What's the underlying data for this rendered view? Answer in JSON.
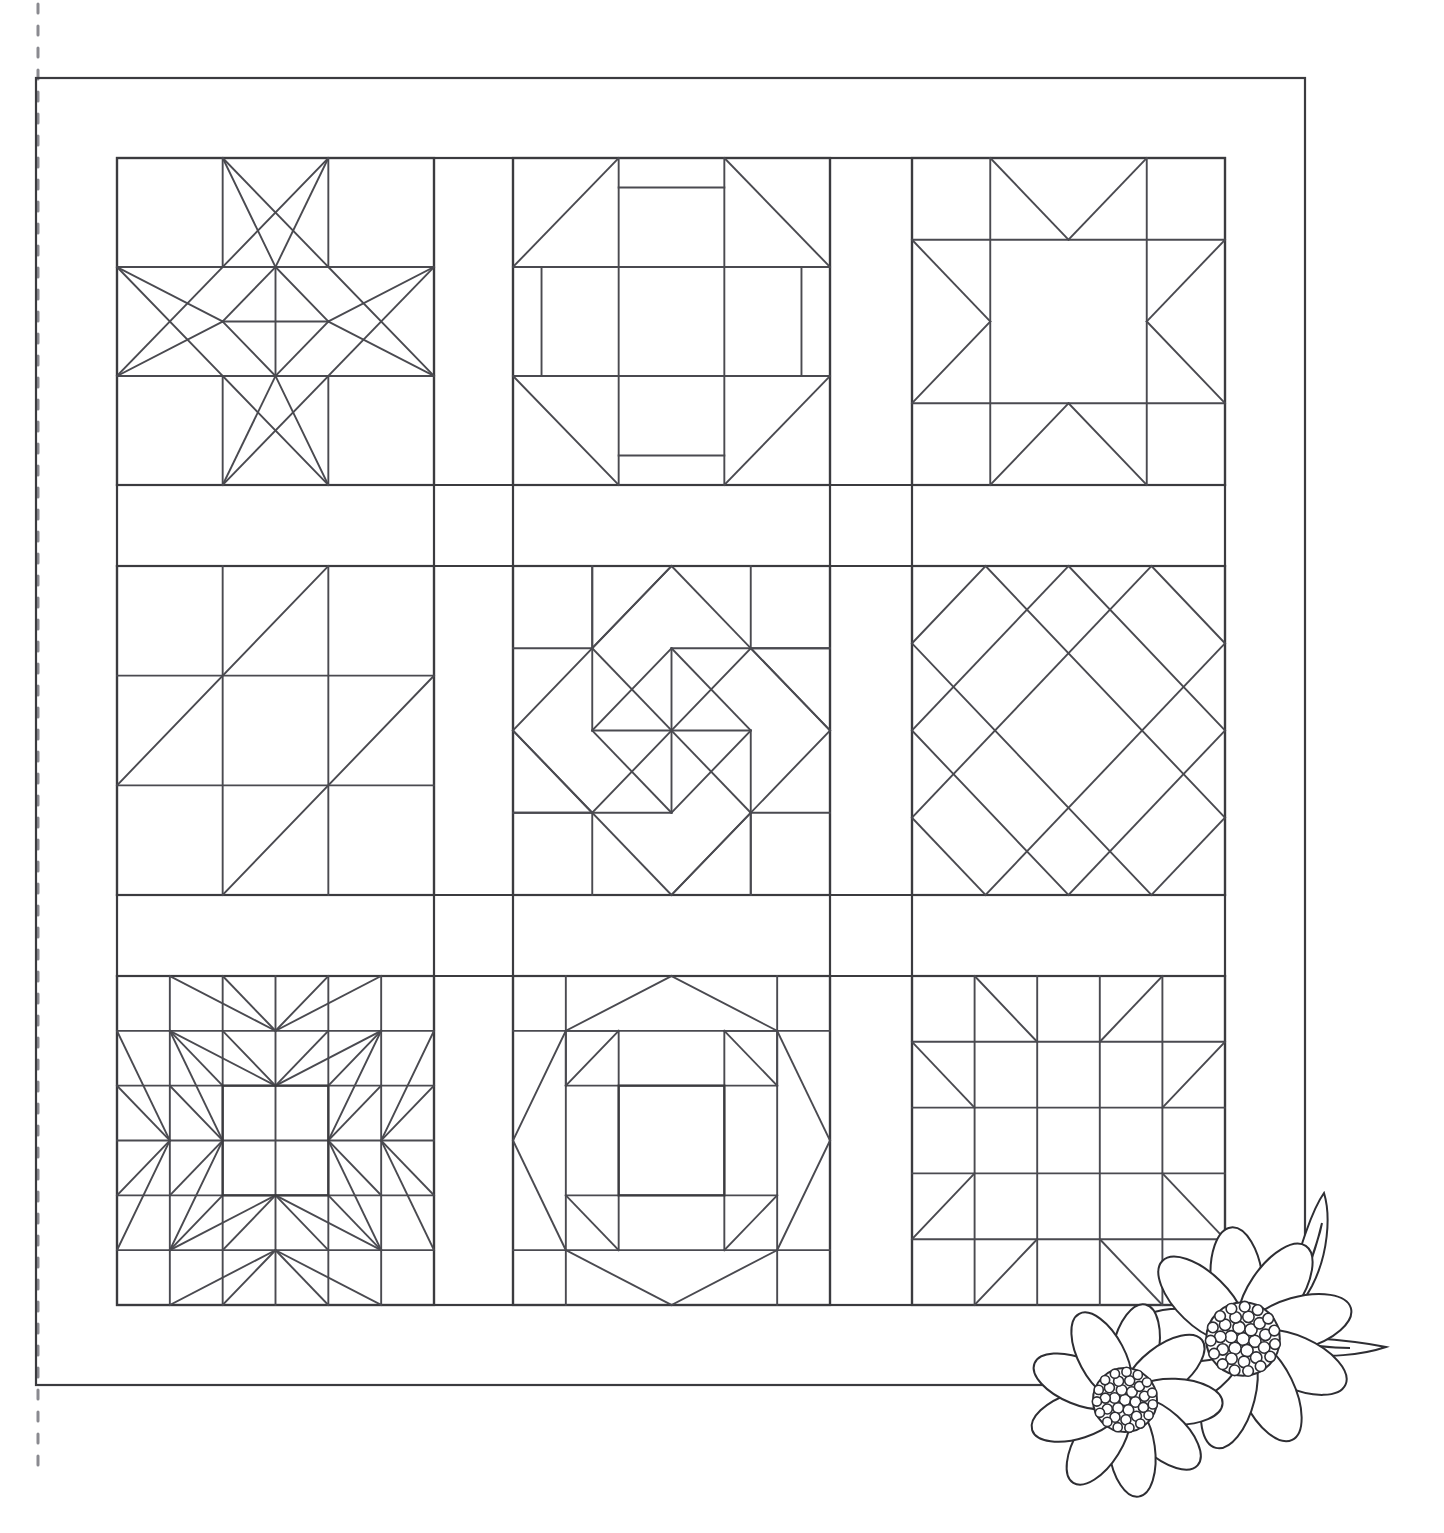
{
  "document": {
    "title": "Sampler Quilt Pattern Line Drawing",
    "type": "quilt-block-layout-diagram",
    "style": "black-and-white line art / coloring page",
    "background_color": "#ffffff",
    "line_color": "#3b3b3f"
  },
  "canvas": {
    "width": 1444,
    "height": 1533
  },
  "binding_guide": {
    "name": "dashed-vertical-guide-line",
    "x": 38,
    "y_start": 4,
    "y_end": 1470,
    "style": "dashed",
    "color": "#8a8a90"
  },
  "quilt": {
    "outer_border": {
      "x": 36,
      "y": 78,
      "width": 1269,
      "height": 1307
    },
    "inner_border": {
      "x": 117,
      "y": 158,
      "width": 1108,
      "height": 1147
    },
    "sashing": {
      "vertical_lines": [
        434,
        513,
        830,
        912
      ],
      "horizontal_lines": [
        485,
        566,
        895,
        976
      ]
    },
    "columns": [
      {
        "x": 117,
        "width": 317
      },
      {
        "x": 513,
        "width": 317
      },
      {
        "x": 912,
        "width": 313
      }
    ],
    "rows": [
      {
        "y": 158,
        "height": 327
      },
      {
        "y": 566,
        "height": 329
      },
      {
        "y": 976,
        "height": 329
      }
    ]
  },
  "blocks": [
    {
      "index": 1,
      "row": 1,
      "col": 1,
      "name": "ohio-star-variant",
      "label": "Ohio Star / Square-in-a-Square Star",
      "grid": "3x3"
    },
    {
      "index": 2,
      "row": 1,
      "col": 2,
      "name": "churn-dash",
      "label": "Churn Dash / Monkey Wrench",
      "grid": "3x3"
    },
    {
      "index": 3,
      "row": 1,
      "col": 3,
      "name": "sawtooth-star",
      "label": "Sawtooth Star",
      "grid": "4x4"
    },
    {
      "index": 4,
      "row": 2,
      "col": 1,
      "name": "nine-patch-diagonals",
      "label": "Nine Patch with Diagonals",
      "grid": "3x3"
    },
    {
      "index": 5,
      "row": 2,
      "col": 2,
      "name": "pinwheel-star",
      "label": "Pinwheel Star / Twisting Star",
      "grid": "4x4"
    },
    {
      "index": 6,
      "row": 2,
      "col": 3,
      "name": "on-point-lattice",
      "label": "On-Point Diamond Lattice",
      "grid": "diagonal"
    },
    {
      "index": 7,
      "row": 3,
      "col": 1,
      "name": "feathered-star",
      "label": "Feathered Star",
      "grid": "6x6"
    },
    {
      "index": 8,
      "row": 3,
      "col": 2,
      "name": "octagon-star",
      "label": "Star with Octagon Center",
      "grid": "6x6"
    },
    {
      "index": 9,
      "row": 3,
      "col": 3,
      "name": "corner-triangle-grid",
      "label": "Five Patch with Corner Triangles",
      "grid": "5x5"
    }
  ],
  "floral_motif": {
    "name": "daisy-flower-spray",
    "position": {
      "x": 1055,
      "y": 1185,
      "width": 390,
      "height": 348
    },
    "elements": [
      {
        "name": "flower-large-upper-right",
        "petal_count": 9,
        "center": "dotted-cluster"
      },
      {
        "name": "flower-small-lower-left",
        "petal_count": 9,
        "center": "dotted-cluster"
      },
      {
        "name": "leaf-upper",
        "shape": "pointed-narrow"
      },
      {
        "name": "leaf-right",
        "shape": "pointed-narrow"
      }
    ],
    "fill": "#ffffff",
    "stroke": "#2e2e33"
  }
}
